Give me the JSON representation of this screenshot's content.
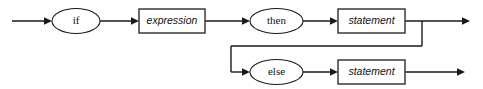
{
  "diagram": {
    "kind": "railroad-syntax-diagram",
    "canvas": {
      "width": 483,
      "height": 89,
      "background": "#ffffff"
    },
    "colors": {
      "rail": "#1a1a1a",
      "ellipse_stroke": "#1a1a1a",
      "box_stroke": "#3a3a3a",
      "node_fill": "#ffffff",
      "text": "#111111"
    },
    "nodes": [
      {
        "id": "if",
        "label": "if",
        "shape": "ellipse",
        "kind": "terminal",
        "cx": 76,
        "cy": 21,
        "rx": 24,
        "ry": 12.5
      },
      {
        "id": "expression",
        "label": "expression",
        "shape": "box",
        "kind": "nonterminal",
        "x": 139,
        "y": 9,
        "width": 66,
        "height": 24
      },
      {
        "id": "then",
        "label": "then",
        "shape": "ellipse",
        "kind": "terminal",
        "cx": 276.5,
        "cy": 21,
        "rx": 26.5,
        "ry": 12.5
      },
      {
        "id": "statement-then",
        "label": "statement",
        "shape": "box",
        "kind": "nonterminal",
        "x": 338,
        "y": 9,
        "width": 67,
        "height": 24
      },
      {
        "id": "else",
        "label": "else",
        "shape": "ellipse",
        "kind": "terminal",
        "cx": 276.5,
        "cy": 72,
        "rx": 26.5,
        "ry": 12.5
      },
      {
        "id": "statement-else",
        "label": "statement",
        "shape": "box",
        "kind": "nonterminal",
        "x": 338,
        "y": 60,
        "width": 67,
        "height": 24
      }
    ],
    "rails": {
      "entry": {
        "x1": 12,
        "y1": 21,
        "x2": 52,
        "y2": 21,
        "arrow": true
      },
      "if_to_expression": {
        "x1": 100,
        "y1": 21,
        "x2": 139,
        "y2": 21,
        "arrow": true
      },
      "expression_to_then": {
        "x1": 205,
        "y1": 21,
        "x2": 250,
        "y2": 21,
        "arrow": true
      },
      "then_to_statement": {
        "x1": 303,
        "y1": 21,
        "x2": 338,
        "y2": 21,
        "arrow": true
      },
      "statement_to_exit": {
        "x1": 405,
        "y1": 21,
        "x2": 470,
        "y2": 21,
        "arrow": true
      },
      "branch_down_right": {
        "x": 422,
        "y1": 21,
        "y2": 46
      },
      "branch_across": {
        "x1": 231,
        "y1": 46,
        "x2": 422,
        "y2": 46
      },
      "branch_down_left": {
        "x": 231,
        "y1": 46,
        "y2": 72
      },
      "to_else": {
        "x1": 231,
        "y1": 72,
        "x2": 250,
        "y2": 72,
        "arrow": true
      },
      "else_to_statement": {
        "x1": 303,
        "y1": 72,
        "x2": 338,
        "y2": 72,
        "arrow": true
      },
      "else_statement_to_exit": {
        "x1": 405,
        "y1": 72,
        "x2": 465,
        "y2": 72,
        "arrow": true
      }
    }
  }
}
